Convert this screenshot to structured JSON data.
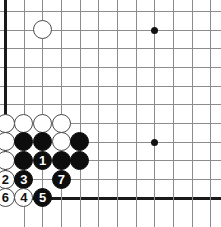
{
  "board": {
    "title": "Go board diagram - bottom left corner",
    "width": 221,
    "height": 227,
    "background_color": "#ffffff",
    "line_color": "#8c8c8c",
    "edge_color": "#1a1a1a",
    "black_stone_color": "#0d0d0d",
    "white_stone_color": "#ffffff",
    "stone_diameter": 19,
    "cell_size": 18.67,
    "origin_x": 5,
    "origin_y": 11,
    "columns": 12,
    "rows": 11,
    "edges": {
      "left": true,
      "bottom": true,
      "top": false,
      "right": false
    },
    "star_points": [
      {
        "name": "star-point-upper-right",
        "col": 9,
        "row": 2
      },
      {
        "name": "star-point-lower-right",
        "col": 9,
        "row": 8
      }
    ],
    "stones": [
      {
        "name": "white-stone-top-approach",
        "color": "white",
        "col": 3,
        "row": 2,
        "label": ""
      },
      {
        "name": "white-stone-wall-a",
        "color": "white",
        "col": 1,
        "row": 7,
        "label": ""
      },
      {
        "name": "white-stone-wall-b",
        "color": "white",
        "col": 2,
        "row": 7,
        "label": ""
      },
      {
        "name": "white-stone-wall-c",
        "color": "white",
        "col": 3,
        "row": 7,
        "label": ""
      },
      {
        "name": "white-stone-wall-d",
        "color": "white",
        "col": 4,
        "row": 7,
        "label": ""
      },
      {
        "name": "white-stone-inner-left",
        "color": "white",
        "col": 1,
        "row": 8,
        "label": ""
      },
      {
        "name": "black-stone-row8-b",
        "color": "black",
        "col": 2,
        "row": 8,
        "label": ""
      },
      {
        "name": "black-stone-row8-c",
        "color": "black",
        "col": 3,
        "row": 8,
        "label": ""
      },
      {
        "name": "white-stone-row8-d",
        "color": "white",
        "col": 4,
        "row": 8,
        "label": ""
      },
      {
        "name": "black-stone-row8-e",
        "color": "black",
        "col": 5,
        "row": 8,
        "label": ""
      },
      {
        "name": "white-stone-corner-side",
        "color": "white",
        "col": 1,
        "row": 9,
        "label": ""
      },
      {
        "name": "black-stone-row9-b",
        "color": "black",
        "col": 2,
        "row": 9,
        "label": ""
      },
      {
        "name": "black-stone-move-1",
        "color": "black",
        "col": 3,
        "row": 9,
        "label": "1"
      },
      {
        "name": "black-stone-row9-d",
        "color": "black",
        "col": 4,
        "row": 9,
        "label": ""
      },
      {
        "name": "black-stone-row9-e",
        "color": "black",
        "col": 5,
        "row": 9,
        "label": ""
      },
      {
        "name": "white-stone-move-2",
        "color": "white",
        "col": 1,
        "row": 10,
        "label": "2"
      },
      {
        "name": "black-stone-move-3",
        "color": "black",
        "col": 2,
        "row": 10,
        "label": "3"
      },
      {
        "name": "black-stone-move-7",
        "color": "black",
        "col": 4,
        "row": 10,
        "label": "7"
      },
      {
        "name": "white-stone-move-6",
        "color": "white",
        "col": 1,
        "row": 11,
        "label": "6"
      },
      {
        "name": "white-stone-move-4",
        "color": "white",
        "col": 2,
        "row": 11,
        "label": "4"
      },
      {
        "name": "black-stone-move-5",
        "color": "black",
        "col": 3,
        "row": 11,
        "label": "5"
      }
    ]
  }
}
